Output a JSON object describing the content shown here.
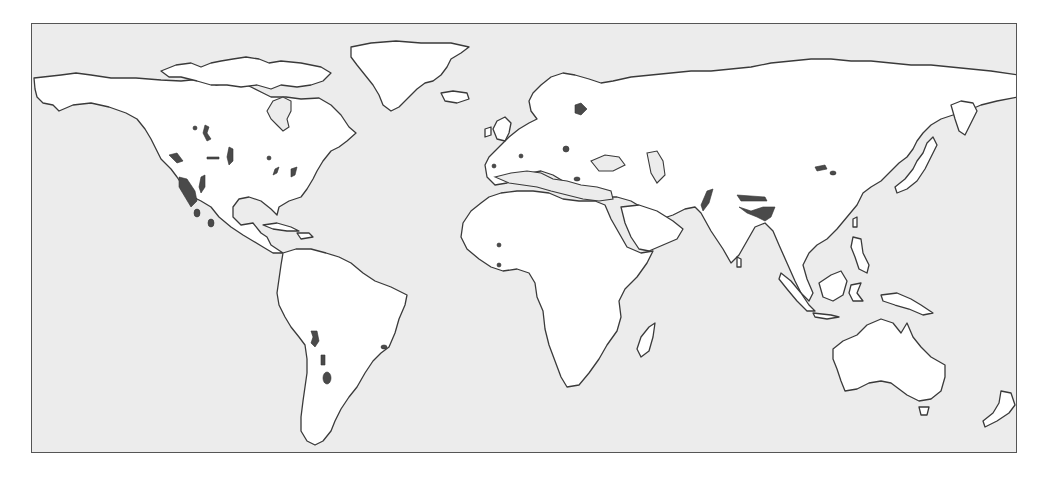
{
  "figure": {
    "type": "world-map",
    "projection": "equirectangular",
    "colors": {
      "ocean": "#ececec",
      "land": "#ffffff",
      "coastline": "#3a3a3a",
      "highlighted_regions": "#4a4a4a",
      "frame": "#555555"
    },
    "legend": "none",
    "highlighted_regions": [
      {
        "region": "Western North America (Great Basin / Sonoran)",
        "x": 185,
        "y": 188
      },
      {
        "region": "Baja California / Mexico",
        "x": 196,
        "y": 212
      },
      {
        "region": "Central Canada interior",
        "x": 205,
        "y": 128
      },
      {
        "region": "Rocky Mountains",
        "x": 230,
        "y": 155
      },
      {
        "region": "Eastern US",
        "x": 268,
        "y": 170
      },
      {
        "region": "Central Andes",
        "x": 312,
        "y": 338
      },
      {
        "region": "Southern Andes",
        "x": 326,
        "y": 375
      },
      {
        "region": "Eastern Brazil",
        "x": 383,
        "y": 346
      },
      {
        "region": "Fennoscandia",
        "x": 578,
        "y": 108
      },
      {
        "region": "Iberia",
        "x": 493,
        "y": 164
      },
      {
        "region": "Alps",
        "x": 565,
        "y": 148
      },
      {
        "region": "Balkans / Greece",
        "x": 576,
        "y": 178
      },
      {
        "region": "West Africa",
        "x": 498,
        "y": 264
      },
      {
        "region": "Zagros / Iran",
        "x": 710,
        "y": 200
      },
      {
        "region": "Himalaya / Tibet",
        "x": 760,
        "y": 205
      },
      {
        "region": "Mongolia",
        "x": 820,
        "y": 170
      }
    ]
  }
}
